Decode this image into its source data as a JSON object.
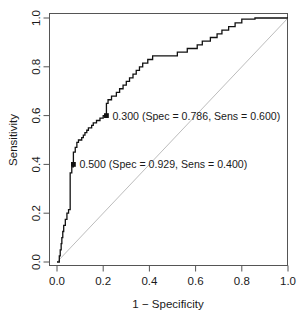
{
  "chart_data": {
    "type": "line",
    "title": "",
    "subtitle": "",
    "xlabel": "1 − Specificity",
    "ylabel": "Sensitivity",
    "xlim": [
      0.0,
      1.0
    ],
    "ylim": [
      0.0,
      1.0
    ],
    "xticks": [
      "0.0",
      "0.2",
      "0.4",
      "0.6",
      "0.8",
      "1.0"
    ],
    "xtick_values": [
      0.0,
      0.2,
      0.4,
      0.6,
      0.8,
      1.0
    ],
    "yticks": [
      "0.0",
      "0.2",
      "0.4",
      "0.6",
      "0.8",
      "1.0"
    ],
    "ytick_values": [
      0.0,
      0.2,
      0.4,
      0.6,
      0.8,
      1.0
    ],
    "grid": false,
    "legend": "none",
    "series": [
      {
        "name": "ROC curve",
        "color": "#111111",
        "step": "staircase",
        "points": [
          [
            0.0,
            0.0
          ],
          [
            0.01,
            0.0
          ],
          [
            0.01,
            0.025
          ],
          [
            0.014,
            0.025
          ],
          [
            0.014,
            0.05
          ],
          [
            0.018,
            0.05
          ],
          [
            0.018,
            0.075
          ],
          [
            0.021,
            0.075
          ],
          [
            0.021,
            0.1
          ],
          [
            0.025,
            0.1
          ],
          [
            0.025,
            0.125
          ],
          [
            0.029,
            0.125
          ],
          [
            0.029,
            0.15
          ],
          [
            0.036,
            0.15
          ],
          [
            0.036,
            0.175
          ],
          [
            0.043,
            0.175
          ],
          [
            0.043,
            0.2
          ],
          [
            0.05,
            0.2
          ],
          [
            0.05,
            0.215
          ],
          [
            0.057,
            0.215
          ],
          [
            0.057,
            0.24
          ],
          [
            0.057,
            0.265
          ],
          [
            0.057,
            0.29
          ],
          [
            0.057,
            0.315
          ],
          [
            0.057,
            0.34
          ],
          [
            0.057,
            0.365
          ],
          [
            0.064,
            0.365
          ],
          [
            0.064,
            0.39
          ],
          [
            0.071,
            0.39
          ],
          [
            0.071,
            0.4
          ],
          [
            0.071,
            0.425
          ],
          [
            0.071,
            0.45
          ],
          [
            0.079,
            0.45
          ],
          [
            0.079,
            0.47
          ],
          [
            0.086,
            0.47
          ],
          [
            0.086,
            0.49
          ],
          [
            0.093,
            0.49
          ],
          [
            0.093,
            0.5
          ],
          [
            0.107,
            0.5
          ],
          [
            0.107,
            0.51
          ],
          [
            0.114,
            0.51
          ],
          [
            0.114,
            0.52
          ],
          [
            0.121,
            0.52
          ],
          [
            0.121,
            0.53
          ],
          [
            0.129,
            0.53
          ],
          [
            0.129,
            0.54
          ],
          [
            0.136,
            0.54
          ],
          [
            0.136,
            0.55
          ],
          [
            0.15,
            0.55
          ],
          [
            0.15,
            0.56
          ],
          [
            0.157,
            0.56
          ],
          [
            0.157,
            0.57
          ],
          [
            0.171,
            0.57
          ],
          [
            0.171,
            0.58
          ],
          [
            0.186,
            0.58
          ],
          [
            0.186,
            0.59
          ],
          [
            0.2,
            0.59
          ],
          [
            0.2,
            0.6
          ],
          [
            0.214,
            0.6
          ],
          [
            0.214,
            0.625
          ],
          [
            0.214,
            0.65
          ],
          [
            0.221,
            0.65
          ],
          [
            0.221,
            0.665
          ],
          [
            0.236,
            0.665
          ],
          [
            0.236,
            0.68
          ],
          [
            0.257,
            0.68
          ],
          [
            0.257,
            0.695
          ],
          [
            0.271,
            0.695
          ],
          [
            0.271,
            0.71
          ],
          [
            0.286,
            0.71
          ],
          [
            0.286,
            0.725
          ],
          [
            0.3,
            0.725
          ],
          [
            0.3,
            0.74
          ],
          [
            0.314,
            0.74
          ],
          [
            0.314,
            0.755
          ],
          [
            0.329,
            0.755
          ],
          [
            0.329,
            0.77
          ],
          [
            0.343,
            0.77
          ],
          [
            0.343,
            0.785
          ],
          [
            0.357,
            0.785
          ],
          [
            0.357,
            0.8
          ],
          [
            0.371,
            0.8
          ],
          [
            0.371,
            0.815
          ],
          [
            0.393,
            0.815
          ],
          [
            0.393,
            0.83
          ],
          [
            0.414,
            0.83
          ],
          [
            0.414,
            0.845
          ],
          [
            0.443,
            0.845
          ],
          [
            0.521,
            0.845
          ],
          [
            0.521,
            0.86
          ],
          [
            0.564,
            0.86
          ],
          [
            0.564,
            0.875
          ],
          [
            0.607,
            0.875
          ],
          [
            0.607,
            0.89
          ],
          [
            0.629,
            0.89
          ],
          [
            0.629,
            0.905
          ],
          [
            0.664,
            0.905
          ],
          [
            0.664,
            0.92
          ],
          [
            0.693,
            0.92
          ],
          [
            0.693,
            0.935
          ],
          [
            0.714,
            0.935
          ],
          [
            0.714,
            0.95
          ],
          [
            0.743,
            0.95
          ],
          [
            0.743,
            0.965
          ],
          [
            0.771,
            0.965
          ],
          [
            0.771,
            0.98
          ],
          [
            0.8,
            0.98
          ],
          [
            0.8,
            0.995
          ],
          [
            0.857,
            0.995
          ],
          [
            0.857,
            1.0
          ],
          [
            1.0,
            1.0
          ]
        ]
      },
      {
        "name": "chance diagonal",
        "color": "#b4b4b4",
        "step": "straight",
        "points": [
          [
            0.0,
            0.0
          ],
          [
            1.0,
            1.0
          ]
        ]
      }
    ],
    "annotations": [
      {
        "name": "threshold-0.300",
        "threshold": "0.300",
        "spec": "0.786",
        "sens": "0.600",
        "label": "0.300 (Spec = 0.786, Sens = 0.600)",
        "x": 0.214,
        "y": 0.6,
        "marker": "filled-square"
      },
      {
        "name": "threshold-0.500",
        "threshold": "0.500",
        "spec": "0.929",
        "sens": "0.400",
        "label": "0.500 (Spec = 0.929, Sens = 0.400)",
        "x": 0.071,
        "y": 0.4,
        "marker": "filled-square"
      }
    ],
    "colors": {
      "curve": "#111111",
      "diagonal": "#b4b4b4",
      "axis": "#555555",
      "text": "#1a1a1a",
      "background": "#ffffff"
    }
  }
}
